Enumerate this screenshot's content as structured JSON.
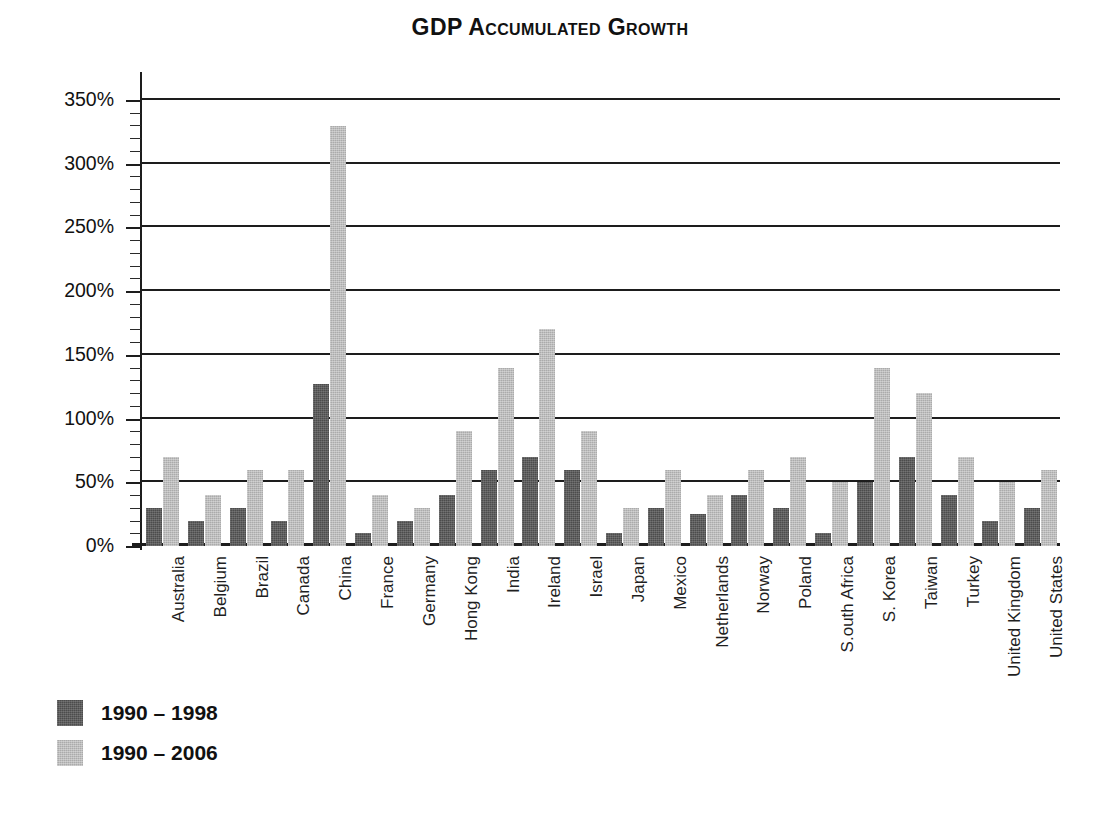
{
  "chart_data": {
    "type": "bar",
    "title": "GDP Accumulated Growth",
    "xlabel": "",
    "ylabel": "",
    "ylim": [
      0,
      350
    ],
    "ytick_labels": [
      "0%",
      "50%",
      "100%",
      "150%",
      "200%",
      "250%",
      "300%",
      "350%"
    ],
    "ytick_values": [
      0,
      50,
      100,
      150,
      200,
      250,
      300,
      350
    ],
    "minor_tick_step": 10,
    "grid": "horizontal",
    "legend_position": "bottom-left",
    "categories": [
      "Australia",
      "Belgium",
      "Brazil",
      "Canada",
      "China",
      "France",
      "Germany",
      "Hong Kong",
      "India",
      "Ireland",
      "Israel",
      "Japan",
      "Mexico",
      "Netherlands",
      "Norway",
      "Poland",
      "S.outh Africa",
      "S. Korea",
      "Taiwan",
      "Turkey",
      "United Kingdom",
      "United States"
    ],
    "series": [
      {
        "name": "1990 – 1998",
        "color": "#4c4c4c",
        "values": [
          30,
          20,
          30,
          20,
          127,
          10,
          20,
          40,
          60,
          70,
          60,
          10,
          30,
          25,
          40,
          30,
          10,
          50,
          70,
          40,
          20,
          30
        ]
      },
      {
        "name": "1990 – 2006",
        "color": "#ababab",
        "values": [
          70,
          40,
          60,
          60,
          330,
          40,
          30,
          90,
          140,
          170,
          90,
          30,
          60,
          40,
          60,
          70,
          50,
          140,
          120,
          70,
          50,
          60
        ]
      }
    ]
  },
  "legend": {
    "entries": [
      {
        "label": "1990 – 1998",
        "swatch": "dark"
      },
      {
        "label": "1990 – 2006",
        "swatch": "light"
      }
    ]
  }
}
